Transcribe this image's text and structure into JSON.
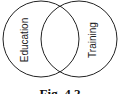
{
  "diagram": {
    "type": "venn",
    "sets": [
      {
        "label": "Education"
      },
      {
        "label": "Training"
      }
    ],
    "caption": "Fig. 4.2",
    "stroke_color": "#222222"
  }
}
